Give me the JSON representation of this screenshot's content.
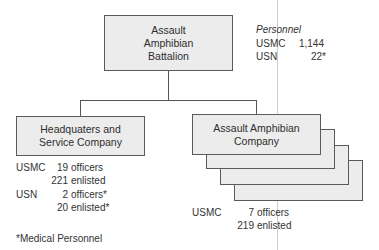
{
  "battalion": {
    "name_lines": [
      "Assault",
      "Amphibian",
      "Battalion"
    ],
    "personnel": {
      "heading": "Personnel",
      "rows": [
        {
          "label": "USMC",
          "value": "1,144"
        },
        {
          "label": "USN",
          "value": "22*"
        }
      ]
    }
  },
  "hq_company": {
    "name_lines": [
      "Headquaters and",
      "Service Company"
    ],
    "stats": [
      {
        "label": "USMC",
        "count": "19",
        "type": "officers"
      },
      {
        "label": "",
        "count": "221",
        "type": "enlisted"
      },
      {
        "label": "USN",
        "count": "2",
        "type": "officers*"
      },
      {
        "label": "",
        "count": "20",
        "type": "enlisted*"
      }
    ]
  },
  "amphibian_company": {
    "name_lines": [
      "Assault Amphibian",
      "Company"
    ],
    "stack_count": 4,
    "stats": [
      {
        "label": "USMC",
        "count": "7",
        "type": "officers"
      },
      {
        "label": "",
        "count": "219",
        "type": "enlisted"
      }
    ]
  },
  "footnote": "*Medical Personnel"
}
